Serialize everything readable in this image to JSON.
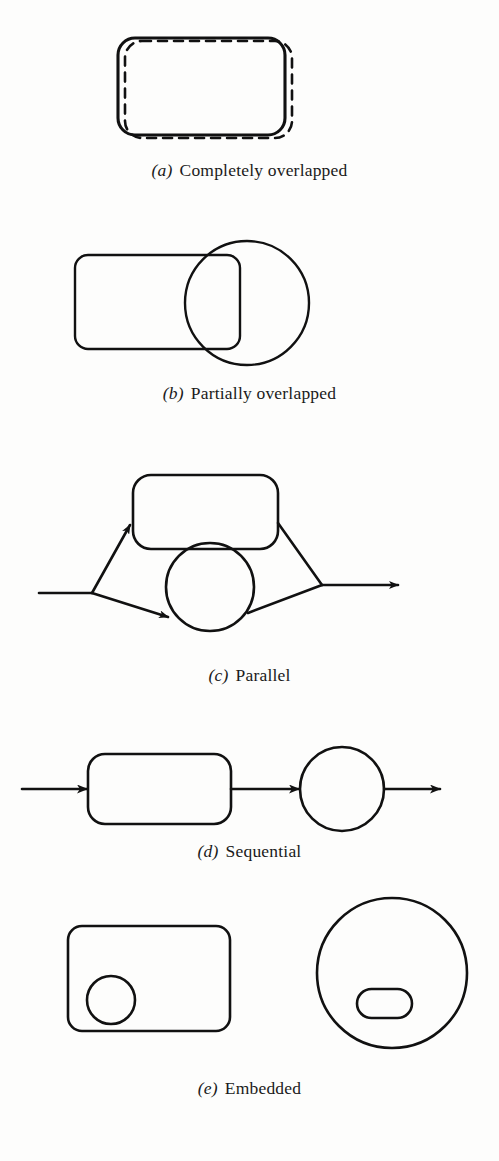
{
  "figure": {
    "background_color": "#fdfdfc",
    "stroke_color": "#111111",
    "fill_color": "none",
    "panels": [
      {
        "index": "(a)",
        "label": "Completely overlapped",
        "shapes": "solid rounded rectangle with dashed rounded rectangle offset behind it",
        "caption_top": 160
      },
      {
        "index": "(b)",
        "label": "Partially overlapped",
        "shapes": "rounded rectangle overlapping a circle",
        "caption_top": 383
      },
      {
        "index": "(c)",
        "label": "Parallel",
        "shapes": "input line splitting into arrows to a rounded rectangle and a circle, merging to one output arrow",
        "caption_top": 665
      },
      {
        "index": "(d)",
        "label": "Sequential",
        "shapes": "arrow into rounded rectangle, arrow into circle, arrow out",
        "caption_top": 841
      },
      {
        "index": "(e)",
        "label": "Embedded",
        "shapes": "circle inside a rounded rectangle, and a pill shape inside a circle",
        "caption_top": 1085
      }
    ]
  }
}
